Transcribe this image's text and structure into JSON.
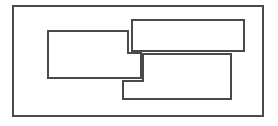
{
  "diagram": {
    "width": 278,
    "height": 126,
    "background": "#ffffff",
    "stroke_color": "#4a4a4a",
    "shapes": [
      {
        "name": "outer-frame",
        "type": "polygon",
        "points": "13,6 263,6 263,116 13,116"
      },
      {
        "name": "left-notched-rect",
        "type": "polygon",
        "points": "48,31 128,31 128,53 141,53 141,78 48,78"
      },
      {
        "name": "top-right-rect",
        "type": "polygon",
        "points": "132,20 244,20 244,51 132,51"
      },
      {
        "name": "bottom-right-notched-rect",
        "type": "polygon",
        "points": "143,54 231,54 231,99 123,99 123,81 143,81"
      }
    ]
  }
}
